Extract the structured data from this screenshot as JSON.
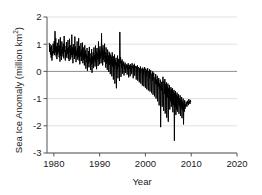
{
  "figure": {
    "background": "#ffffff",
    "plot_area": {
      "left": 47,
      "top": 17,
      "right": 237,
      "bottom": 153
    }
  },
  "labels": {
    "ylabel_main": "Sea Ice Anomaly (million km",
    "ylabel_sup": "2",
    "ylabel_close": ")",
    "xlabel": "Year"
  },
  "chart_data": {
    "type": "line",
    "title": "",
    "xlabel": "Year",
    "ylabel": "Sea Ice Anomaly (million km2)",
    "xlim": [
      1978.5,
      2020.0
    ],
    "ylim": [
      -3,
      2
    ],
    "xticks": [
      1980,
      1990,
      2000,
      2010,
      2020
    ],
    "xtick_labels": [
      "1980",
      "1990",
      "2000",
      "2010",
      "2020"
    ],
    "yticks": [
      2,
      1,
      0,
      -1,
      -2,
      -3
    ],
    "ytick_labels": [
      "2",
      "1",
      "0",
      "-1",
      "-2",
      "-3"
    ],
    "grid": true,
    "grid_color": "#d9d9d9",
    "zero_line_color": "#8c8c8c",
    "legend": null,
    "series": [
      {
        "name": "Sea ice anomaly",
        "color": "#000000",
        "line_width": 1.0,
        "x_start": 1979.0,
        "x_step": 0.0833,
        "values": [
          1.05,
          0.72,
          1.0,
          0.62,
          0.88,
          0.5,
          0.95,
          0.4,
          0.75,
          0.58,
          1.02,
          0.66,
          0.84,
          1.12,
          0.6,
          1.48,
          0.7,
          1.22,
          0.55,
          0.92,
          0.45,
          1.05,
          0.62,
          0.86,
          0.7,
          1.18,
          0.52,
          0.95,
          0.36,
          1.25,
          0.58,
          0.8,
          0.42,
          1.1,
          0.66,
          0.9,
          0.55,
          1.02,
          0.48,
          1.3,
          0.72,
          0.94,
          0.4,
          0.78,
          0.58,
          1.08,
          0.5,
          0.86,
          0.64,
          1.15,
          0.46,
          0.9,
          0.38,
          1.2,
          0.7,
          0.96,
          0.44,
          0.82,
          0.6,
          1.35,
          0.52,
          0.88,
          0.3,
          1.0,
          0.62,
          0.84,
          0.46,
          1.28,
          0.55,
          0.92,
          0.34,
          0.76,
          0.58,
          1.1,
          0.44,
          0.86,
          0.52,
          1.22,
          0.4,
          0.94,
          0.26,
          0.72,
          0.55,
          1.04,
          0.38,
          0.8,
          0.48,
          1.06,
          0.3,
          0.88,
          0.42,
          0.7,
          0.22,
          0.96,
          0.5,
          0.78,
          0.1,
          0.64,
          0.34,
          0.86,
          0.02,
          0.58,
          0.28,
          0.74,
          0.15,
          0.9,
          0.36,
          0.66,
          0.05,
          0.48,
          0.25,
          0.82,
          -0.05,
          0.55,
          0.3,
          0.7,
          0.12,
          0.88,
          0.4,
          0.6,
          0.18,
          0.95,
          0.32,
          0.74,
          0.08,
          0.86,
          0.44,
          0.68,
          0.2,
          1.1,
          0.38,
          0.8,
          0.26,
          0.92,
          0.48,
          0.72,
          0.3,
          1.4,
          0.55,
          0.84,
          0.22,
          0.96,
          0.42,
          0.76,
          0.34,
          1.02,
          0.5,
          0.7,
          0.14,
          0.88,
          0.28,
          0.62,
          0.06,
          0.8,
          0.36,
          0.58,
          -0.02,
          0.72,
          0.24,
          0.66,
          -0.1,
          0.6,
          0.3,
          0.54,
          -0.18,
          0.7,
          0.18,
          0.48,
          -0.3,
          0.56,
          0.1,
          0.62,
          -0.45,
          0.42,
          0.22,
          0.5,
          -0.62,
          0.34,
          0.05,
          0.58,
          -0.25,
          0.46,
          0.16,
          0.4,
          -0.35,
          1.45,
          0.3,
          0.52,
          -0.2,
          0.38,
          0.12,
          0.44,
          -0.08,
          0.3,
          0.2,
          0.36,
          -0.15,
          0.25,
          0.08,
          0.32,
          -0.05,
          0.18,
          0.14,
          0.26,
          -0.12,
          0.22,
          0.04,
          0.3,
          -0.22,
          0.16,
          0.1,
          0.24,
          -0.18,
          0.26,
          0.02,
          0.2,
          -0.1,
          0.3,
          0.12,
          0.18,
          -0.25,
          0.22,
          0.05,
          0.28,
          -0.16,
          0.14,
          0.2,
          0.1,
          -0.3,
          0.18,
          0.02,
          0.22,
          -0.34,
          0.08,
          0.16,
          0.04,
          -0.4,
          0.12,
          -0.05,
          0.18,
          -0.45,
          0.06,
          0.1,
          -0.02,
          -0.52,
          0.14,
          -0.1,
          0.08,
          -0.55,
          0.02,
          0.16,
          -0.14,
          -0.6,
          0.1,
          -0.18,
          0.04,
          -0.66,
          -0.06,
          0.12,
          -0.22,
          -0.7,
          0.02,
          -0.26,
          0.08,
          -0.74,
          -0.12,
          0.04,
          -0.3,
          -0.8,
          -0.08,
          -0.34,
          0.0,
          -0.86,
          -0.18,
          -0.05,
          -0.4,
          -0.92,
          -0.22,
          -0.45,
          -0.1,
          -1.0,
          -0.3,
          -0.5,
          -0.16,
          -1.1,
          -0.36,
          -0.56,
          -0.24,
          -1.25,
          -0.44,
          -0.62,
          -0.3,
          -2.05,
          -0.52,
          -0.7,
          -0.38,
          -1.3,
          -0.58,
          -0.2,
          -0.75,
          -1.45,
          -0.35,
          -0.82,
          -0.28,
          -1.55,
          -0.48,
          -0.88,
          -0.4,
          -1.7,
          -0.55,
          -0.95,
          -0.45,
          -1.85,
          -0.62,
          -1.02,
          -0.5,
          -1.4,
          -0.7,
          -1.1,
          -0.58,
          -1.3,
          -0.66,
          -1.18,
          -0.62,
          -1.5,
          -0.74,
          -1.25,
          -0.68,
          -2.55,
          -0.8,
          -1.32,
          -0.72,
          -1.6,
          -0.86,
          -1.4,
          -0.78,
          -1.48,
          -0.92,
          -1.22,
          -0.84,
          -1.56,
          -0.98,
          -1.3,
          -0.88,
          -1.64,
          -1.04,
          -1.36,
          -0.94,
          -1.72,
          -1.1,
          -1.42,
          -1.0,
          -1.95,
          -1.16,
          -1.48,
          -1.06,
          -1.38,
          -1.22,
          -1.28,
          -1.12,
          -1.2,
          -1.3,
          -1.08,
          -1.18,
          -1.14,
          -1.24,
          -1.02,
          -1.16,
          -1.1,
          -1.2,
          -1.05,
          -1.12
        ]
      }
    ]
  }
}
